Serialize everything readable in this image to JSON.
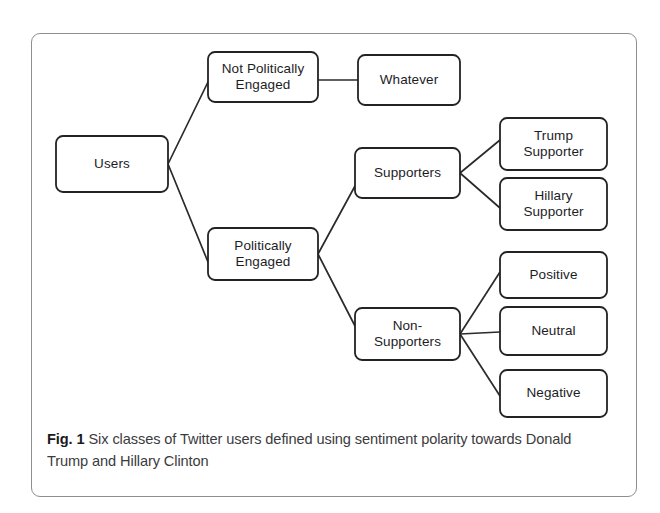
{
  "figure": {
    "frame": {
      "border_color": "#8e8e90",
      "background": "#ffffff"
    },
    "caption": {
      "label": "Fig. 1",
      "text": " Six classes of Twitter users defined using sentiment polarity towards Donald Trump and Hillary Clinton"
    },
    "diagram": {
      "type": "tree",
      "node_stroke_color": "#232325",
      "edge_stroke_color": "#2a2a2c",
      "text_color": "#1d1d1f",
      "nodes": [
        {
          "id": "users",
          "label_lines": [
            "Users"
          ],
          "x": 56,
          "y": 136,
          "w": 112,
          "h": 56
        },
        {
          "id": "not-politically-engaged",
          "label_lines": [
            "Not Politically",
            "Engaged"
          ],
          "x": 208,
          "y": 52,
          "w": 110,
          "h": 50
        },
        {
          "id": "whatever",
          "label_lines": [
            "Whatever"
          ],
          "x": 358,
          "y": 55,
          "w": 102,
          "h": 50
        },
        {
          "id": "politically-engaged",
          "label_lines": [
            "Politically",
            "Engaged"
          ],
          "x": 208,
          "y": 228,
          "w": 110,
          "h": 52
        },
        {
          "id": "supporters",
          "label_lines": [
            "Supporters"
          ],
          "x": 355,
          "y": 148,
          "w": 105,
          "h": 50
        },
        {
          "id": "non-supporters",
          "label_lines": [
            "Non-",
            "Supporters"
          ],
          "x": 355,
          "y": 308,
          "w": 105,
          "h": 52
        },
        {
          "id": "trump-supporter",
          "label_lines": [
            "Trump",
            "Supporter"
          ],
          "x": 500,
          "y": 118,
          "w": 107,
          "h": 52
        },
        {
          "id": "hillary-supporter",
          "label_lines": [
            "Hillary",
            "Supporter"
          ],
          "x": 500,
          "y": 178,
          "w": 107,
          "h": 52
        },
        {
          "id": "positive",
          "label_lines": [
            "Positive"
          ],
          "x": 500,
          "y": 252,
          "w": 107,
          "h": 46
        },
        {
          "id": "neutral",
          "label_lines": [
            "Neutral"
          ],
          "x": 500,
          "y": 307,
          "w": 107,
          "h": 48
        },
        {
          "id": "negative",
          "label_lines": [
            "Negative"
          ],
          "x": 500,
          "y": 370,
          "w": 107,
          "h": 47
        }
      ],
      "edges": [
        {
          "from": "users",
          "to": "not-politically-engaged",
          "x1": 168,
          "y1": 164,
          "x2": 208,
          "y2": 82
        },
        {
          "from": "users",
          "to": "politically-engaged",
          "x1": 168,
          "y1": 164,
          "x2": 208,
          "y2": 262
        },
        {
          "from": "not-politically-engaged",
          "to": "whatever",
          "x1": 318,
          "y1": 80,
          "x2": 358,
          "y2": 80
        },
        {
          "from": "politically-engaged",
          "to": "supporters",
          "x1": 318,
          "y1": 254,
          "x2": 355,
          "y2": 186
        },
        {
          "from": "politically-engaged",
          "to": "non-supporters",
          "x1": 318,
          "y1": 254,
          "x2": 355,
          "y2": 326
        },
        {
          "from": "supporters",
          "to": "trump-supporter",
          "x1": 460,
          "y1": 173,
          "x2": 500,
          "y2": 140
        },
        {
          "from": "supporters",
          "to": "hillary-supporter",
          "x1": 460,
          "y1": 173,
          "x2": 500,
          "y2": 208
        },
        {
          "from": "non-supporters",
          "to": "positive",
          "x1": 460,
          "y1": 334,
          "x2": 500,
          "y2": 272
        },
        {
          "from": "non-supporters",
          "to": "neutral",
          "x1": 460,
          "y1": 334,
          "x2": 500,
          "y2": 332
        },
        {
          "from": "non-supporters",
          "to": "negative",
          "x1": 460,
          "y1": 334,
          "x2": 500,
          "y2": 396
        }
      ]
    }
  }
}
